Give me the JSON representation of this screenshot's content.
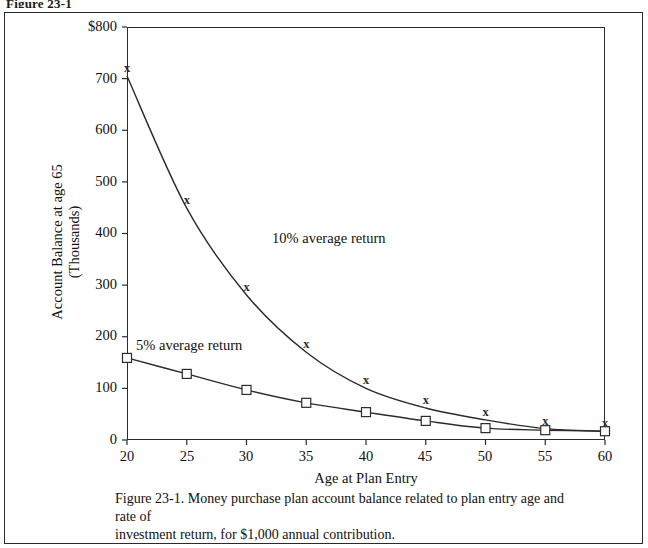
{
  "figure_header": "Figure 23-1",
  "caption": {
    "line1": "Figure 23-1. Money purchase plan account balance related to plan entry age and rate of",
    "line2": "investment return, for $1,000 annual contribution."
  },
  "axes": {
    "y_label_line1": "Account Balance at age 65",
    "y_label_line2": "(Thousands)",
    "x_label": "Age at Plan Entry",
    "y_ticks": [
      "$800",
      "700",
      "600",
      "500",
      "400",
      "300",
      "200",
      "100",
      "0"
    ],
    "x_ticks": [
      "20",
      "25",
      "30",
      "35",
      "40",
      "45",
      "50",
      "55",
      "60"
    ]
  },
  "annotations": {
    "ten_percent": "10% average return",
    "five_percent": "5% average return"
  },
  "colors": {
    "line": "#2b2b2b",
    "frame": "#2b2b2b",
    "text": "#111111",
    "background": "#ffffff"
  },
  "chart_data": {
    "type": "line",
    "title": "Money purchase plan account balance related to plan entry age and rate of investment return, for $1,000 annual contribution.",
    "xlabel": "Age at Plan Entry",
    "ylabel": "Account Balance at age 65 (Thousands)",
    "x": [
      20,
      25,
      30,
      35,
      40,
      45,
      50,
      55,
      60
    ],
    "xlim": [
      20,
      60
    ],
    "ylim": [
      0,
      800
    ],
    "ytick_values": [
      0,
      100,
      200,
      300,
      400,
      500,
      600,
      700,
      800
    ],
    "xtick_values": [
      20,
      25,
      30,
      35,
      40,
      45,
      50,
      55,
      60
    ],
    "grid": false,
    "legend": "annotations-inline",
    "series": [
      {
        "name": "10% average return",
        "marker": "x",
        "values": [
          705,
          449,
          281,
          170,
          100,
          62,
          39,
          22,
          17
        ]
      },
      {
        "name": "5% average return",
        "marker": "square",
        "values": [
          159,
          128,
          97,
          72,
          54,
          37,
          23,
          19,
          17
        ]
      }
    ]
  }
}
